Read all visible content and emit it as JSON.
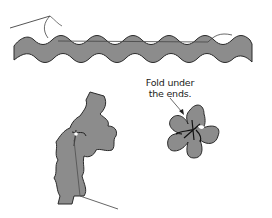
{
  "diagram": {
    "colors": {
      "ribbon_fill": "#8c8c8c",
      "outline": "#2a2a2a",
      "thread": "#555555",
      "background": "#ffffff"
    },
    "steps": [
      {
        "id": "step-1",
        "description": "Running stitch along straight rick-rack strip with needle and thread"
      },
      {
        "id": "step-2",
        "description": "Gather rick-rack by pulling thread, coiling into flower"
      },
      {
        "id": "step-3",
        "description": "Finished rick-rack flower with ends folded under"
      }
    ],
    "annotation": {
      "line1": "Fold under",
      "line2": "the ends."
    }
  }
}
